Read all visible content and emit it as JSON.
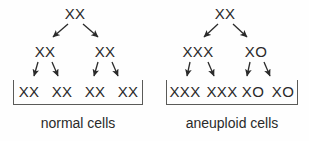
{
  "figure": {
    "background_color": "#fefefe",
    "ink_color": "#2a2a2a",
    "bracket_color": "#5a5a58"
  },
  "panels": [
    {
      "id": "normal",
      "caption": "normal cells",
      "caption_x": 78,
      "generations": [
        {
          "level": "parent",
          "cells": [
            {
              "label": "XX",
              "x": 75
            }
          ]
        },
        {
          "level": "first-division",
          "cells": [
            {
              "label": "XX",
              "x": 45
            },
            {
              "label": "XX",
              "x": 105
            }
          ]
        },
        {
          "level": "second-division",
          "cells": [
            {
              "label": "XX",
              "x": 29
            },
            {
              "label": "XX",
              "x": 62
            },
            {
              "label": "XX",
              "x": 95
            },
            {
              "label": "XX",
              "x": 128
            }
          ]
        }
      ],
      "bracket": {
        "x": 13,
        "width": 130
      }
    },
    {
      "id": "aneuploid",
      "caption": "aneuploid cells",
      "caption_x": 232,
      "generations": [
        {
          "level": "parent",
          "cells": [
            {
              "label": "XX",
              "x": 225
            }
          ]
        },
        {
          "level": "first-division",
          "cells": [
            {
              "label": "XXX",
              "x": 198
            },
            {
              "label": "XO",
              "x": 256
            }
          ]
        },
        {
          "level": "second-division",
          "cells": [
            {
              "label": "XXX",
              "x": 185
            },
            {
              "label": "XXX",
              "x": 222
            },
            {
              "label": "XO",
              "x": 253
            },
            {
              "label": "XO",
              "x": 283
            }
          ]
        }
      ],
      "bracket": {
        "x": 166,
        "width": 132
      }
    }
  ],
  "arrows": {
    "description": "cell-division arrows",
    "color": "#2a2a2a",
    "segments": [
      {
        "id": "normal-gen1-left",
        "x1": 68,
        "y1": 24,
        "x2": 52,
        "y2": 38
      },
      {
        "id": "normal-gen1-right",
        "x1": 83,
        "y1": 24,
        "x2": 99,
        "y2": 38
      },
      {
        "id": "normal-gen2-a",
        "x1": 38,
        "y1": 62,
        "x2": 33,
        "y2": 77
      },
      {
        "id": "normal-gen2-b",
        "x1": 52,
        "y1": 62,
        "x2": 59,
        "y2": 77
      },
      {
        "id": "normal-gen2-c",
        "x1": 98,
        "y1": 62,
        "x2": 93,
        "y2": 77
      },
      {
        "id": "normal-gen2-d",
        "x1": 112,
        "y1": 62,
        "x2": 119,
        "y2": 77
      },
      {
        "id": "aneuploid-gen1-left",
        "x1": 218,
        "y1": 24,
        "x2": 203,
        "y2": 38
      },
      {
        "id": "aneuploid-gen1-right",
        "x1": 233,
        "y1": 24,
        "x2": 248,
        "y2": 38
      },
      {
        "id": "aneuploid-gen2-a",
        "x1": 190,
        "y1": 62,
        "x2": 186,
        "y2": 77
      },
      {
        "id": "aneuploid-gen2-b",
        "x1": 208,
        "y1": 62,
        "x2": 215,
        "y2": 77
      },
      {
        "id": "aneuploid-gen2-c",
        "x1": 250,
        "y1": 62,
        "x2": 247,
        "y2": 77
      },
      {
        "id": "aneuploid-gen2-d",
        "x1": 264,
        "y1": 62,
        "x2": 271,
        "y2": 77
      }
    ]
  }
}
